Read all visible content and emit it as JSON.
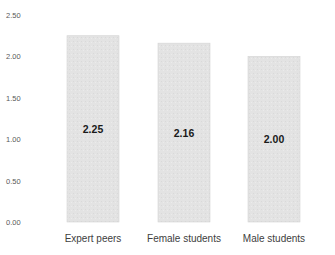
{
  "chart_data": {
    "type": "bar",
    "title": "",
    "xlabel": "",
    "ylabel": "",
    "categories": [
      "Expert peers",
      "Female students",
      "Male students"
    ],
    "values": [
      2.25,
      2.16,
      2.0
    ],
    "data_labels": [
      "2.25",
      "2.16",
      "2.00"
    ],
    "ylim": [
      0,
      2.5
    ],
    "yticks": [
      0.0,
      0.5,
      1.0,
      1.5,
      2.0,
      2.5
    ],
    "ytick_labels": [
      "0.00",
      "0.50",
      "1.00",
      "1.50",
      "2.00",
      "2.50"
    ],
    "grid": false,
    "legend": "none",
    "bar_color": "#e3e3e3",
    "bar_border_color": "#d4d4d4"
  }
}
